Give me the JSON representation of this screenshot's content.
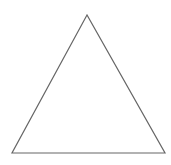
{
  "diagram": {
    "background": "#ffffff",
    "shapes": [
      {
        "type": "triangle",
        "name": "equilateral-triangle",
        "points": [
          [
            87,
            15
          ],
          [
            12,
            153
          ],
          [
            165,
            153
          ]
        ],
        "stroke": "#666666",
        "stroke_width": 1.2,
        "fill": "none"
      }
    ]
  }
}
